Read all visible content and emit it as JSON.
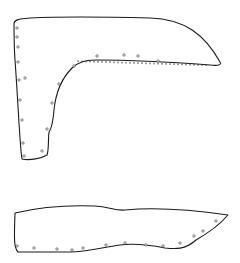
{
  "figure": {
    "width": 240,
    "height": 263,
    "stroke_color": "#1a1a1a",
    "background": "#ffffff",
    "pieces": [
      {
        "name": "l-shaped-piece",
        "path": "M14,24 C14,20 18,19 30,18 C70,16 110,17 150,18 C185,19 205,35 220,62 C222,65 218,66 210,65 C170,62 130,60 95,60 C85,60 78,62 72,68 C62,78 56,90 54,110 C53,122 52,128 49,132 C48,140 49,150 47,155 C42,158 30,161 22,159 C20,150 18,100 15,60 C14,45 14,30 14,24 Z",
        "holes": [
          [
            17,
            28
          ],
          [
            17,
            37
          ],
          [
            18,
            47
          ],
          [
            18,
            62
          ],
          [
            19,
            80
          ],
          [
            25,
            78
          ],
          [
            20,
            100
          ],
          [
            22,
            120
          ],
          [
            23,
            143
          ],
          [
            24,
            156
          ],
          [
            42,
            151
          ],
          [
            47,
            129
          ],
          [
            52,
            103
          ],
          [
            59,
            84
          ],
          [
            74,
            66
          ],
          [
            97,
            56
          ],
          [
            124,
            55
          ],
          [
            138,
            56
          ],
          [
            158,
            61
          ]
        ],
        "stitches_x": [
          78,
          82,
          86,
          90,
          94,
          98,
          102,
          106,
          110,
          114,
          118,
          122,
          126,
          130,
          134,
          138,
          142,
          146,
          150,
          154,
          158,
          162,
          166,
          170,
          174,
          178,
          182,
          186,
          190,
          194,
          198,
          202,
          206
        ],
        "stitches_y_start": 62,
        "stitches_y_end": 66
      },
      {
        "name": "strip-piece",
        "path": "M15,213 C40,207 70,205 95,206 C110,207 115,211 125,210 C145,208 180,208 228,215 C222,222 210,232 196,240 C185,250 175,249 165,248 C150,245 135,243 120,245 C100,248 85,252 70,252 C50,252 30,252 18,252 C14,248 14,240 15,213 Z",
        "holes": [
          [
            17,
            246
          ],
          [
            34,
            248
          ],
          [
            57,
            249
          ],
          [
            72,
            250
          ],
          [
            83,
            248
          ],
          [
            106,
            245
          ],
          [
            125,
            243
          ],
          [
            146,
            245
          ],
          [
            163,
            246
          ],
          [
            180,
            243
          ],
          [
            194,
            236
          ],
          [
            203,
            231
          ],
          [
            216,
            221
          ]
        ]
      }
    ]
  }
}
